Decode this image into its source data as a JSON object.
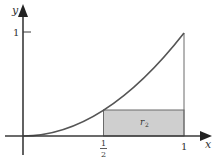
{
  "diagram": {
    "type": "function-plot",
    "function": "y = x^2",
    "axes": {
      "x_label": "x",
      "y_label": "y"
    },
    "ticks": {
      "x_half_num": "1",
      "x_half_den": "2",
      "x_one": "1",
      "y_one": "1"
    },
    "region": {
      "label_main": "r",
      "label_sub": "2",
      "x_from": 0.5,
      "x_to": 1,
      "height": 0.25
    },
    "colors": {
      "axis": "#3a3a3a",
      "curve": "#555555",
      "rect_fill": "#cfcfcf",
      "rect_stroke": "#6a6a6a",
      "text": "#333333"
    }
  }
}
